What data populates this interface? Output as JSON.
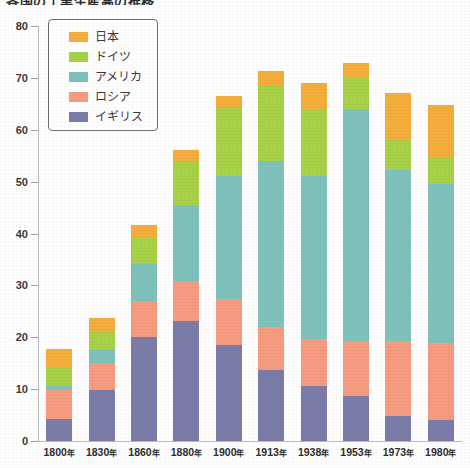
{
  "chart_data": {
    "type": "bar",
    "subtype": "stacked-bar",
    "title": "各国の工業生産高の推移",
    "xlabel": "",
    "ylabel": "",
    "ylim": [
      0,
      80
    ],
    "yticks": [
      0,
      10,
      20,
      30,
      40,
      50,
      60,
      70,
      80
    ],
    "grid": false,
    "legend_position": "upper-left-inside",
    "categories": [
      "1800年",
      "1830年",
      "1860年",
      "1880年",
      "1900年",
      "1913年",
      "1938年",
      "1953年",
      "1973年",
      "1980年"
    ],
    "series": [
      {
        "name": "イギリス",
        "color": "#7b7ca8",
        "values": [
          4.3,
          9.8,
          20.0,
          23.2,
          18.6,
          13.7,
          10.7,
          8.6,
          4.8,
          4.0
        ]
      },
      {
        "name": "ロシア",
        "color": "#f79c80",
        "values": [
          5.6,
          5.3,
          7.0,
          7.6,
          8.8,
          8.2,
          9.0,
          10.7,
          14.4,
          14.8
        ]
      },
      {
        "name": "アメリカ",
        "color": "#7fc2bc",
        "values": [
          0.8,
          2.4,
          7.2,
          14.7,
          23.6,
          32.0,
          31.4,
          44.7,
          33.0,
          30.7
        ]
      },
      {
        "name": "ドイツ",
        "color": "#a8d248",
        "values": [
          3.5,
          3.7,
          4.9,
          8.5,
          13.2,
          14.8,
          12.7,
          5.9,
          5.8,
          5.3
        ]
      },
      {
        "name": "日本",
        "color": "#f5ae3c",
        "values": [
          3.5,
          2.6,
          2.6,
          2.1,
          2.3,
          2.7,
          5.2,
          2.9,
          9.0,
          10.0
        ]
      }
    ],
    "totals": [
      17.7,
      23.8,
      41.7,
      56.1,
      66.5,
      71.4,
      69.0,
      72.8,
      67.0,
      64.8
    ],
    "annotations": []
  },
  "legend": {
    "items": [
      {
        "label": "日本",
        "color": "#f5ae3c"
      },
      {
        "label": "ドイツ",
        "color": "#a8d248"
      },
      {
        "label": "アメリカ",
        "color": "#7fc2bc"
      },
      {
        "label": "ロシア",
        "color": "#f79c80"
      },
      {
        "label": "イギリス",
        "color": "#7b7ca8"
      }
    ]
  },
  "axis": {
    "y_tick_labels": [
      "80",
      "70",
      "60",
      "50",
      "40",
      "30",
      "20",
      "10",
      "0"
    ],
    "x_tick_labels": [
      "1800年",
      "1830年",
      "1860年",
      "1880年",
      "1900年",
      "1913年",
      "1938年",
      "1953年",
      "1973年",
      "1980年"
    ]
  },
  "colors": {
    "japan": "#f5ae3c",
    "germany": "#a8d248",
    "usa": "#7fc2bc",
    "russia": "#f79c80",
    "uk": "#7b7ca8",
    "axis": "#b9bcbe",
    "text": "#2e2e2e"
  }
}
